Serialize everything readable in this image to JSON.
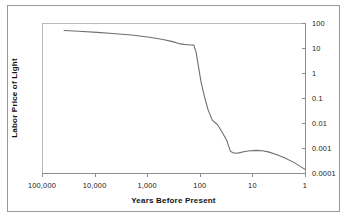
{
  "chart_data": {
    "type": "line",
    "title": "",
    "xlabel": "Years Before Present",
    "ylabel": "Labor Price of Light",
    "x_scale": "log",
    "y_scale": "log",
    "x_reversed": true,
    "grid": false,
    "legend": null,
    "xlim": [
      100000,
      1
    ],
    "ylim": [
      0.0001,
      100
    ],
    "x_ticks": [
      100000,
      10000,
      1000,
      100,
      10,
      1
    ],
    "x_tick_labels": [
      "100,000",
      "10,000",
      "1,000",
      "100",
      "10",
      "1"
    ],
    "y_ticks": [
      100,
      10,
      1,
      0.1,
      0.01,
      0.001,
      0.0001
    ],
    "y_tick_labels": [
      "100",
      "10",
      "1",
      "0.1",
      "0.01",
      "0.001",
      "0.0001"
    ],
    "y_axis_position": "right",
    "series": [
      {
        "name": "Labor Price of Light",
        "x": [
          38000,
          20000,
          9000,
          4500,
          2000,
          900,
          500,
          330,
          250,
          200,
          170,
          150,
          130,
          118,
          105,
          95,
          82,
          70,
          58,
          46,
          38,
          31,
          26,
          22,
          18,
          14,
          11,
          8.5,
          6.5,
          5,
          3.5,
          2.4,
          1.6,
          1.0
        ],
        "y": [
          50,
          47,
          42,
          38,
          33,
          27,
          22,
          18,
          15,
          14,
          13.5,
          13.2,
          13,
          7,
          1.6,
          0.45,
          0.12,
          0.035,
          0.013,
          0.0085,
          0.0045,
          0.0021,
          0.00072,
          0.00062,
          0.00064,
          0.00072,
          0.00078,
          0.0008,
          0.00078,
          0.0007,
          0.00055,
          0.0004,
          0.00026,
          0.00014
        ]
      }
    ]
  },
  "axes": {
    "x_title": "Years Before Present",
    "y_title": "Labor Price of Light"
  }
}
